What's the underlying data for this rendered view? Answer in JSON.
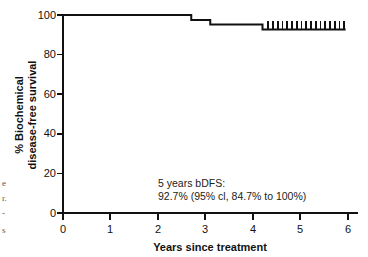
{
  "chart_data": {
    "type": "line",
    "title": "",
    "subtitle": "",
    "xlabel": "Years since treatment",
    "ylabel_line1": "% Biochemical",
    "ylabel_line2": "disease-free survival",
    "xlim": [
      0,
      6
    ],
    "ylim": [
      0,
      100
    ],
    "xticks": [
      "0",
      "1",
      "2",
      "3",
      "4",
      "5",
      "6"
    ],
    "xtick_values": [
      0,
      1,
      2,
      3,
      4,
      5,
      6
    ],
    "yticks": [
      "0",
      "20",
      "40",
      "60",
      "80",
      "100"
    ],
    "ytick_values": [
      0,
      20,
      40,
      60,
      80,
      100
    ],
    "grid": false,
    "legend": "none",
    "curve_color": "#111111",
    "series": [
      {
        "name": "Biochemical disease-free survival",
        "step": "post",
        "x": [
          0.0,
          2.7,
          2.7,
          3.1,
          3.1,
          4.2,
          4.2,
          5.95
        ],
        "y": [
          100.0,
          100.0,
          97.5,
          97.5,
          95.2,
          95.2,
          92.7,
          92.7
        ]
      }
    ],
    "censored_x": [
      4.32,
      4.42,
      4.52,
      4.62,
      4.72,
      4.82,
      4.92,
      5.02,
      5.12,
      5.22,
      5.32,
      5.42,
      5.52,
      5.62,
      5.72,
      5.82,
      5.92
    ],
    "censored_y": 92.7,
    "annotations": [
      {
        "line1": "5 years bDFS:",
        "line2": "92.7% (95% cl, 84.7% to 100%)",
        "x": 2.0,
        "y": 17
      }
    ]
  },
  "annotation": {
    "line1": "5 years bDFS:",
    "line2": "92.7% (95% cl, 84.7% to 100%)"
  },
  "axes": {
    "x_title": "Years since treatment",
    "y_title_line1": "% Biochemical",
    "y_title_line2": "disease-free survival",
    "xticks": [
      "0",
      "1",
      "2",
      "3",
      "4",
      "5",
      "6"
    ],
    "yticks": [
      "100",
      "80",
      "60",
      "40",
      "20",
      "0"
    ]
  },
  "edge_fragments": [
    "e",
    "r.",
    "-",
    "s"
  ]
}
